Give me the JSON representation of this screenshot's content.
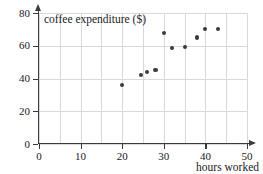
{
  "chart_data": {
    "type": "scatter",
    "title": "",
    "xlabel": "hours worked",
    "ylabel": "coffee expenditure ($)",
    "xlim": [
      0,
      50
    ],
    "ylim": [
      0,
      80
    ],
    "xticks": [
      0,
      10,
      20,
      30,
      40,
      50
    ],
    "yticks": [
      0,
      20,
      40,
      60,
      80
    ],
    "xtick_labels": [
      "0",
      "10",
      "20",
      "30",
      "40",
      "50"
    ],
    "ytick_labels": [
      "0",
      "20",
      "40",
      "60",
      "80"
    ],
    "x_minor_step": 5,
    "y_minor_step": 20,
    "grid": true,
    "legend": null,
    "marker": "filled-circle",
    "marker_color": "#3b3b3b",
    "grid_color": "#d9d9d9",
    "axis_color": "#3a3a3a",
    "points": [
      {
        "x": 20,
        "y": 36
      },
      {
        "x": 24.5,
        "y": 42
      },
      {
        "x": 26,
        "y": 44
      },
      {
        "x": 28,
        "y": 45
      },
      {
        "x": 30,
        "y": 68
      },
      {
        "x": 32,
        "y": 58.5
      },
      {
        "x": 35,
        "y": 59
      },
      {
        "x": 38,
        "y": 65
      },
      {
        "x": 40,
        "y": 70
      },
      {
        "x": 43,
        "y": 70
      }
    ],
    "x_gridlines": [
      0,
      5,
      10,
      15,
      20,
      25,
      30,
      35,
      40,
      45,
      50
    ],
    "y_gridlines": [
      0,
      20,
      40,
      60,
      80
    ]
  }
}
